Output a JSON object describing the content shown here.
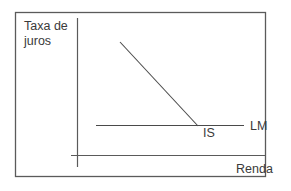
{
  "diagram": {
    "type": "IS-LM model",
    "y_axis_label_line1": "Taxa de",
    "y_axis_label_line2": "juros",
    "x_axis_label": "Renda",
    "curves": [
      {
        "name": "IS",
        "label": "IS",
        "shape": "downward-sloping line"
      },
      {
        "name": "LM",
        "label": "LM",
        "shape": "horizontal line"
      }
    ],
    "colors": {
      "frame": "#5a5a5a",
      "axes": "#5a5a5a",
      "curves": "#4a4a4a",
      "text": "#3a3a3a",
      "background": "#ffffff"
    }
  }
}
